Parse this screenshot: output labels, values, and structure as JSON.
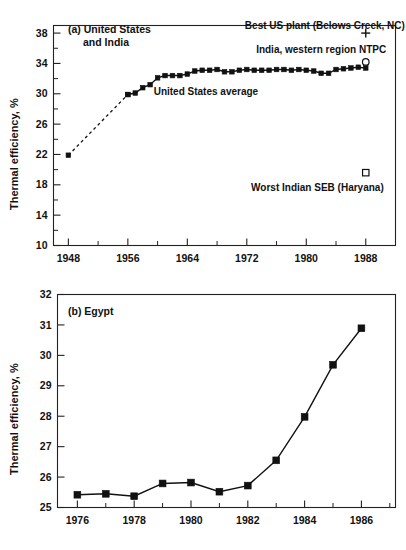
{
  "figure": {
    "background": "#ffffff",
    "ink": "#111111"
  },
  "chart_data": [
    {
      "id": "panel_a",
      "type": "line",
      "title": "(a) United States",
      "title_line2": "and India",
      "xlabel": "",
      "ylabel": "Thermal efficiency, %",
      "xlim": [
        1946,
        1992
      ],
      "ylim": [
        10,
        39
      ],
      "xticks": [
        1948,
        1956,
        1964,
        1972,
        1980,
        1988
      ],
      "xticklabels": [
        "1948",
        "1956",
        "1964",
        "1972",
        "1980",
        "1988"
      ],
      "xminor_step": 4,
      "yticks": [
        10,
        14,
        18,
        22,
        26,
        30,
        34,
        38
      ],
      "yticklabels": [
        "10",
        "14",
        "18",
        "22",
        "26",
        "30",
        "34",
        "38"
      ],
      "yminor_step": 2,
      "grid": false,
      "legend": "none",
      "series": [
        {
          "name": "United States average",
          "marker": "filled-square",
          "line": "solid",
          "x": [
            1956,
            1957,
            1958,
            1959,
            1960,
            1961,
            1962,
            1963,
            1964,
            1965,
            1966,
            1967,
            1968,
            1969,
            1970,
            1971,
            1972,
            1973,
            1974,
            1975,
            1976,
            1977,
            1978,
            1979,
            1980,
            1981,
            1982,
            1983,
            1984,
            1985,
            1986,
            1987,
            1988
          ],
          "values": [
            29.9,
            30.1,
            30.8,
            31.2,
            32.1,
            32.4,
            32.4,
            32.4,
            32.6,
            33.0,
            33.1,
            33.1,
            33.2,
            32.9,
            32.9,
            33.1,
            33.2,
            33.1,
            33.1,
            33.1,
            33.2,
            33.2,
            33.1,
            33.2,
            33.1,
            33.0,
            32.7,
            32.7,
            33.2,
            33.3,
            33.4,
            33.5,
            33.4
          ]
        },
        {
          "name": "United States average (extrapolated)",
          "marker": "filled-square",
          "line": "dashed",
          "x": [
            1948,
            1956
          ],
          "values": [
            21.9,
            29.9
          ]
        }
      ],
      "point_markers": [
        {
          "name": "Best US plant (Belows Creek, NC)",
          "label": "Best US plant (Belows Creek, NC)",
          "marker": "plus",
          "x": 1988,
          "y": 38.0,
          "label_x": 1982.5,
          "label_y": 39.0,
          "label_anchor": "middle"
        },
        {
          "name": "India, western region NTPC",
          "label": "India, western region NTPC",
          "marker": "open-circle",
          "x": 1988,
          "y": 34.2,
          "label_x": 1982.0,
          "label_y": 35.9,
          "label_anchor": "middle"
        },
        {
          "name": "Worst Indian SEB (Haryana)",
          "label": "Worst Indian SEB (Haryana)",
          "marker": "open-square",
          "x": 1988,
          "y": 19.6,
          "label_x": 1981.5,
          "label_y": 17.6,
          "label_anchor": "middle"
        }
      ],
      "inline_annotations": [
        {
          "name": "united-states-average-annotation",
          "text": "United States average",
          "x": 1966.5,
          "y": 30.3,
          "anchor": "middle"
        }
      ]
    },
    {
      "id": "panel_b",
      "type": "line",
      "title": "(b) Egypt",
      "xlabel": "",
      "ylabel": "Thermal efficiency, %",
      "xlim": [
        1975.3,
        1987.2
      ],
      "ylim": [
        25,
        32
      ],
      "xticks": [
        1976,
        1978,
        1980,
        1982,
        1984,
        1986
      ],
      "xticklabels": [
        "1976",
        "1978",
        "1980",
        "1982",
        "1984",
        "1986"
      ],
      "xminor_step": 1,
      "yticks": [
        25,
        26,
        27,
        28,
        29,
        30,
        31,
        32
      ],
      "yticklabels": [
        "25",
        "26",
        "27",
        "28",
        "29",
        "30",
        "31",
        "32"
      ],
      "grid": false,
      "legend": "none",
      "series": [
        {
          "name": "Egypt thermal efficiency",
          "marker": "filled-square",
          "line": "solid",
          "x": [
            1976,
            1977,
            1978,
            1979,
            1980,
            1981,
            1982,
            1983,
            1984,
            1985,
            1986
          ],
          "values": [
            25.42,
            25.45,
            25.37,
            25.79,
            25.82,
            25.52,
            25.72,
            26.55,
            27.98,
            29.69,
            30.89
          ]
        }
      ],
      "point_markers": [],
      "inline_annotations": []
    }
  ]
}
